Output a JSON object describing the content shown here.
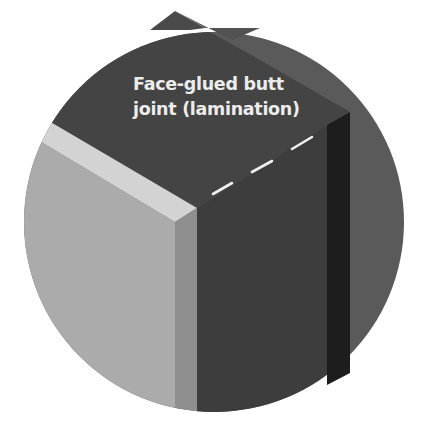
{
  "diagram": {
    "callout": {
      "line1": "Face-glued butt",
      "line2": "joint (lamination)"
    },
    "colors": {
      "background": "#ffffff",
      "circle_backdrop": "#5a5a5a",
      "light_board_face": "#a9a9a9",
      "light_board_top_edge": "#d2d2d2",
      "light_board_side": "#8e8e8e",
      "dark_board_face": "#3c3c3c",
      "dark_board_top": "#474747",
      "dark_board_edge_strip": "#1c1c1c",
      "glue_line_dashes": "#f0f0f0",
      "label_text": "#ececec"
    }
  }
}
